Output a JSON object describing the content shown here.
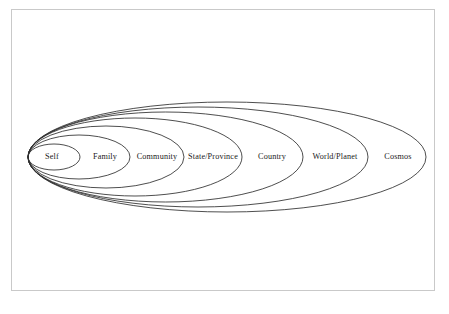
{
  "diagram": {
    "type": "nested-ellipses",
    "background_color": "#ffffff",
    "frame_color": "#c9c9c9",
    "line_color": "#2e2e2e",
    "label_color": "#1a1a1a",
    "common_left_vertex_x": 28,
    "center_y": 157,
    "spheres": [
      {
        "label": "Self",
        "order": 1,
        "right_vertex_x": 80,
        "semi_minor_y": 13,
        "label_x": 52,
        "label_y": 157
      },
      {
        "label": "Family",
        "order": 2,
        "right_vertex_x": 130,
        "semi_minor_y": 22,
        "label_x": 105,
        "label_y": 157
      },
      {
        "label": "Community",
        "order": 3,
        "right_vertex_x": 184,
        "semi_minor_y": 31,
        "label_x": 157,
        "label_y": 157
      },
      {
        "label": "State/Province",
        "order": 4,
        "right_vertex_x": 242,
        "semi_minor_y": 39,
        "label_x": 213,
        "label_y": 157
      },
      {
        "label": "Country",
        "order": 5,
        "right_vertex_x": 303,
        "semi_minor_y": 45,
        "label_x": 272,
        "label_y": 157
      },
      {
        "label": "World/Planet",
        "order": 6,
        "right_vertex_x": 368,
        "semi_minor_y": 50,
        "label_x": 335,
        "label_y": 157
      },
      {
        "label": "Cosmos",
        "order": 7,
        "right_vertex_x": 426,
        "semi_minor_y": 55,
        "label_x": 398,
        "label_y": 157
      }
    ]
  }
}
